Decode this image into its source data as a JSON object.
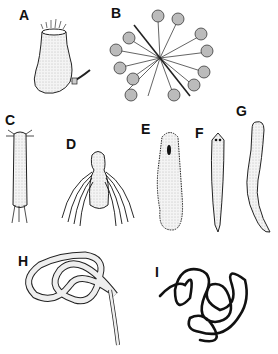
{
  "figure": {
    "panels": [
      {
        "id": "A",
        "label": "A",
        "subject": "urn-shaped organism with ciliated crown and side tube"
      },
      {
        "id": "B",
        "label": "B",
        "subject": "radiating organism with knobbed stalks"
      },
      {
        "id": "C",
        "label": "C",
        "subject": "elongated bristled worm"
      },
      {
        "id": "D",
        "label": "D",
        "subject": "larva with long swimming bristles"
      },
      {
        "id": "E",
        "label": "E",
        "subject": "ciliated elongate body with dark spot"
      },
      {
        "id": "F",
        "label": "F",
        "subject": "flatworm with eyespots"
      },
      {
        "id": "G",
        "label": "G",
        "subject": "curved worm"
      },
      {
        "id": "H",
        "label": "H",
        "subject": "looped threadlike worm"
      },
      {
        "id": "I",
        "label": "I",
        "subject": "tangled dark thread worm"
      }
    ]
  }
}
